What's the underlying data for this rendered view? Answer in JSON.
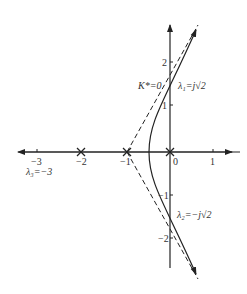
{
  "diagram": {
    "type": "root-locus",
    "axes": {
      "x_ticks": [
        {
          "value": -3,
          "label": "−3"
        },
        {
          "value": -2,
          "label": ""
        },
        {
          "value": -1,
          "label": ""
        },
        {
          "value": 0,
          "label": "0"
        },
        {
          "value": 1,
          "label": "1"
        }
      ],
      "y_ticks": [
        {
          "value": 2,
          "label": "2"
        },
        {
          "value": 1,
          "label": "1"
        },
        {
          "value": -1,
          "label": "−1"
        },
        {
          "value": -2,
          "label": "−2"
        }
      ],
      "x_tick_labels_below": {
        "m2": "−2",
        "m1": "−1"
      }
    },
    "poles": [
      {
        "x": 0,
        "y": 0
      },
      {
        "x": -1,
        "y": 0
      },
      {
        "x": -2,
        "y": 0
      }
    ],
    "annotations": {
      "k_zero": "K*=0",
      "lambda1": "λ₁=j√2",
      "lambda2": "λ₂=−j√2",
      "lambda3": "λ₃=−3"
    }
  }
}
